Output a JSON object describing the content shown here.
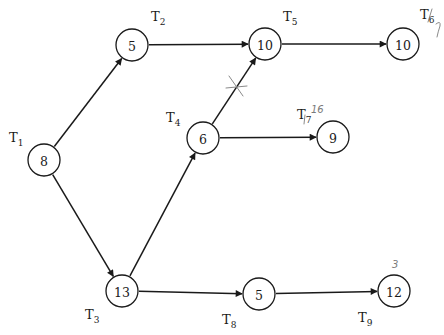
{
  "diagram": {
    "type": "task-precedence-graph",
    "nodes": [
      {
        "id": "T1",
        "label": "T",
        "sub": "1",
        "value": "8",
        "x": 44,
        "y": 160,
        "lx": 9,
        "ly": 142
      },
      {
        "id": "T2",
        "label": "T",
        "sub": "2",
        "value": "5",
        "x": 132,
        "y": 45,
        "lx": 151,
        "ly": 21
      },
      {
        "id": "T3",
        "label": "T",
        "sub": "3",
        "value": "13",
        "x": 122,
        "y": 291,
        "lx": 85,
        "ly": 319
      },
      {
        "id": "T4",
        "label": "T",
        "sub": "4",
        "value": "6",
        "x": 203,
        "y": 138,
        "lx": 166,
        "ly": 122
      },
      {
        "id": "T5",
        "label": "T",
        "sub": "5",
        "value": "10",
        "x": 265,
        "y": 44,
        "lx": 283,
        "ly": 21
      },
      {
        "id": "T6",
        "label": "T",
        "sub": "6",
        "value": "10",
        "x": 403,
        "y": 44,
        "lx": 420,
        "ly": 19
      },
      {
        "id": "T7",
        "label": "T",
        "sub": "7",
        "value": "9",
        "x": 333,
        "y": 137,
        "lx": 297,
        "ly": 119
      },
      {
        "id": "T8",
        "label": "T",
        "sub": "8",
        "value": "5",
        "x": 259,
        "y": 294,
        "lx": 222,
        "ly": 324
      },
      {
        "id": "T9",
        "label": "T",
        "sub": "9",
        "value": "12",
        "x": 394,
        "y": 291,
        "lx": 358,
        "ly": 322
      }
    ],
    "edges": [
      {
        "from": "T1",
        "to": "T2"
      },
      {
        "from": "T1",
        "to": "T3"
      },
      {
        "from": "T2",
        "to": "T5"
      },
      {
        "from": "T3",
        "to": "T4"
      },
      {
        "from": "T3",
        "to": "T8"
      },
      {
        "from": "T4",
        "to": "T5"
      },
      {
        "from": "T4",
        "to": "T7"
      },
      {
        "from": "T5",
        "to": "T6"
      },
      {
        "from": "T8",
        "to": "T9"
      }
    ],
    "annotations": [
      {
        "target": "T4-T5 edge",
        "mark": "X (crossed out)"
      },
      {
        "target": "T6",
        "text": "7"
      },
      {
        "target": "T7",
        "text": "16"
      },
      {
        "target": "T9",
        "text": "3"
      }
    ]
  }
}
